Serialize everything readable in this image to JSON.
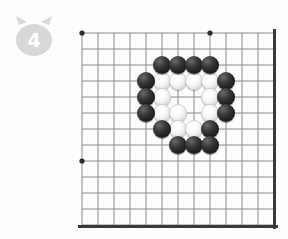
{
  "badge": {
    "icon": "cat-head-icon",
    "number": "4",
    "fill_color": "#d8d8d8"
  },
  "board": {
    "name": "go-board",
    "line_color": "#8a8a8a",
    "edge_color": "#3a3a3a",
    "background_color": "#fdfdfd",
    "grid_spacing": 16,
    "origin_x": 12,
    "origin_y": 19,
    "cols": 13,
    "rows": 13,
    "edges": {
      "top": false,
      "left": false,
      "right": true,
      "bottom": true
    },
    "star_points": [
      {
        "col": 0,
        "row": 0
      },
      {
        "col": 8,
        "row": 0
      },
      {
        "col": 0,
        "row": 8
      }
    ],
    "stone_radius": 9,
    "black_color": "#222222",
    "white_color": "#fafafa",
    "stones": [
      {
        "color": "black",
        "col": 5,
        "row": 2
      },
      {
        "color": "black",
        "col": 6,
        "row": 2
      },
      {
        "color": "black",
        "col": 7,
        "row": 2
      },
      {
        "color": "black",
        "col": 8,
        "row": 2
      },
      {
        "color": "black",
        "col": 4,
        "row": 3
      },
      {
        "color": "white",
        "col": 5,
        "row": 3
      },
      {
        "color": "white",
        "col": 6,
        "row": 3
      },
      {
        "color": "white",
        "col": 7,
        "row": 3
      },
      {
        "color": "white",
        "col": 8,
        "row": 3
      },
      {
        "color": "black",
        "col": 9,
        "row": 3
      },
      {
        "color": "black",
        "col": 4,
        "row": 4
      },
      {
        "color": "white",
        "col": 5,
        "row": 4
      },
      {
        "color": "white",
        "col": 8,
        "row": 4
      },
      {
        "color": "black",
        "col": 9,
        "row": 4
      },
      {
        "color": "black",
        "col": 4,
        "row": 5
      },
      {
        "color": "white",
        "col": 5,
        "row": 5
      },
      {
        "color": "white",
        "col": 6,
        "row": 5
      },
      {
        "color": "white",
        "col": 8,
        "row": 5
      },
      {
        "color": "black",
        "col": 9,
        "row": 5
      },
      {
        "color": "black",
        "col": 5,
        "row": 6
      },
      {
        "color": "white",
        "col": 6,
        "row": 6
      },
      {
        "color": "white",
        "col": 7,
        "row": 6
      },
      {
        "color": "black",
        "col": 8,
        "row": 6
      },
      {
        "color": "black",
        "col": 6,
        "row": 7
      },
      {
        "color": "black",
        "col": 7,
        "row": 7
      },
      {
        "color": "black",
        "col": 8,
        "row": 7
      }
    ]
  }
}
